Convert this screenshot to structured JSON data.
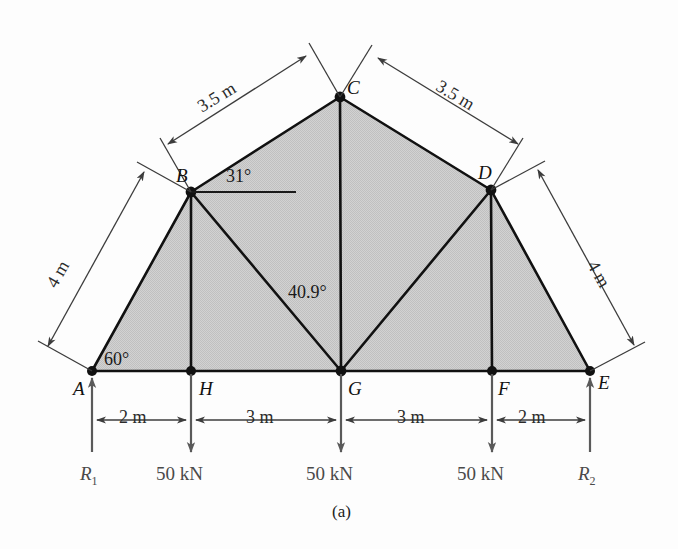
{
  "figure": {
    "caption": "(a)",
    "type": "truss-free-body-diagram",
    "fill_color": "#cccccc",
    "line_color": "#111111",
    "force_color": "#4a4a4a"
  },
  "nodes": [
    {
      "id": "A",
      "label": "A",
      "x": 92,
      "y": 371
    },
    {
      "id": "B",
      "label": "B",
      "x": 191,
      "y": 192
    },
    {
      "id": "C",
      "label": "C",
      "x": 340,
      "y": 97
    },
    {
      "id": "D",
      "label": "D",
      "x": 491,
      "y": 190
    },
    {
      "id": "E",
      "label": "E",
      "x": 590,
      "y": 371
    },
    {
      "id": "F",
      "label": "F",
      "x": 492,
      "y": 371
    },
    {
      "id": "G",
      "label": "G",
      "x": 341,
      "y": 371
    },
    {
      "id": "H",
      "label": "H",
      "x": 191,
      "y": 371
    }
  ],
  "members": [
    {
      "from": "A",
      "to": "B"
    },
    {
      "from": "B",
      "to": "C"
    },
    {
      "from": "C",
      "to": "D"
    },
    {
      "from": "D",
      "to": "E"
    },
    {
      "from": "A",
      "to": "H"
    },
    {
      "from": "H",
      "to": "G"
    },
    {
      "from": "G",
      "to": "F"
    },
    {
      "from": "F",
      "to": "E"
    },
    {
      "from": "B",
      "to": "H"
    },
    {
      "from": "C",
      "to": "G"
    },
    {
      "from": "D",
      "to": "F"
    },
    {
      "from": "B",
      "to": "G"
    },
    {
      "from": "D",
      "to": "G"
    }
  ],
  "dimensions": {
    "chords": [
      {
        "name": "AB",
        "value": "4 m"
      },
      {
        "name": "BC",
        "value": "3.5 m"
      },
      {
        "name": "CD",
        "value": "3.5 m"
      },
      {
        "name": "DE",
        "value": "4 m"
      }
    ],
    "bottom": [
      {
        "name": "A-H",
        "value": "2 m"
      },
      {
        "name": "H-G",
        "value": "3 m"
      },
      {
        "name": "G-F",
        "value": "3 m"
      },
      {
        "name": "F-E",
        "value": "2 m"
      }
    ]
  },
  "angles": [
    {
      "at": "A",
      "value": "60°"
    },
    {
      "at": "B",
      "value": "31°"
    },
    {
      "at": "G",
      "value": "40.9°"
    }
  ],
  "loads": [
    {
      "at": "H",
      "label": "50 kN",
      "direction": "down"
    },
    {
      "at": "G",
      "label": "50 kN",
      "direction": "down"
    },
    {
      "at": "F",
      "label": "50 kN",
      "direction": "down"
    }
  ],
  "reactions": [
    {
      "at": "A",
      "symbol": "R",
      "subscript": "1",
      "direction": "up"
    },
    {
      "at": "E",
      "symbol": "R",
      "subscript": "2",
      "direction": "up"
    }
  ]
}
